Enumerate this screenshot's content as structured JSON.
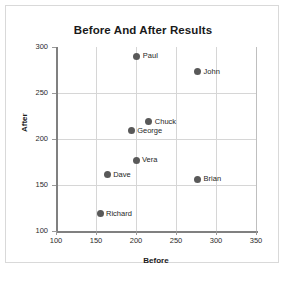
{
  "chart_data": {
    "type": "scatter",
    "title": "Before And After Results",
    "xlabel": "Before",
    "ylabel": "After",
    "xlim": [
      100,
      350
    ],
    "ylim": [
      100,
      300
    ],
    "xticks": [
      100,
      150,
      200,
      250,
      300,
      350
    ],
    "yticks": [
      100,
      150,
      200,
      250,
      300
    ],
    "grid": true,
    "legend": "none",
    "marker_color": "#595959",
    "points": [
      {
        "label": "Paul",
        "x": 201,
        "y": 290
      },
      {
        "label": "John",
        "x": 277,
        "y": 273
      },
      {
        "label": "Chuck",
        "x": 216,
        "y": 219
      },
      {
        "label": "George",
        "x": 194,
        "y": 209
      },
      {
        "label": "Vera",
        "x": 200,
        "y": 177
      },
      {
        "label": "Dave",
        "x": 164,
        "y": 161
      },
      {
        "label": "Brian",
        "x": 277,
        "y": 156
      },
      {
        "label": "Richard",
        "x": 155,
        "y": 119
      }
    ]
  }
}
